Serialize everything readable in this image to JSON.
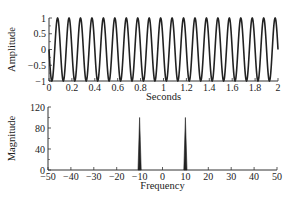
{
  "chart_data": [
    {
      "type": "line",
      "title": "",
      "xlabel": "Seconds",
      "ylabel": "Amplitude",
      "xlim": [
        0,
        2
      ],
      "ylim": [
        -1,
        1
      ],
      "xticks": [
        "0",
        "0.2",
        "0.4",
        "0.6",
        "0.8",
        "1",
        "1.2",
        "1.4",
        "1.6",
        "1.8",
        "2"
      ],
      "yticks": [
        "1",
        "0.5",
        "0",
        "-0.5",
        "-1"
      ],
      "series": [
        {
          "name": "signal",
          "function": "-sin(2*pi*10*t)",
          "frequency_hz": 10,
          "amplitude": 1,
          "t_start": 0,
          "t_end": 2
        }
      ],
      "grid": false
    },
    {
      "type": "line",
      "title": "",
      "xlabel": "Frequency",
      "ylabel": "Magnitude",
      "xlim": [
        -50,
        50
      ],
      "ylim": [
        0,
        120
      ],
      "xticks": [
        "-50",
        "-40",
        "-30",
        "-20",
        "-10",
        "0",
        "10",
        "20",
        "30",
        "40",
        "50"
      ],
      "yticks": [
        "120",
        "80",
        "40",
        "0"
      ],
      "x": [
        -10,
        10
      ],
      "values": [
        100,
        100
      ],
      "grid": false
    }
  ],
  "labels": {
    "top_xlabel": "Seconds",
    "top_ylabel": "Amplitude",
    "bottom_xlabel": "Frequency",
    "bottom_ylabel": "Magnitude"
  }
}
